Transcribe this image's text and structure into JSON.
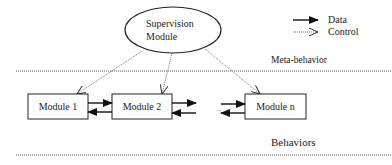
{
  "diagram": {
    "supervisor": {
      "line1": "Supervision",
      "line2": "Module"
    },
    "layers": {
      "meta": "Meta-behavior",
      "behaviors": "Behaviors"
    },
    "modules": [
      {
        "label": "Module 1"
      },
      {
        "label": "Module 2"
      },
      {
        "label": "Module n"
      }
    ],
    "legend": {
      "data": "Data",
      "control": "Control"
    },
    "ellipsis": "..."
  }
}
